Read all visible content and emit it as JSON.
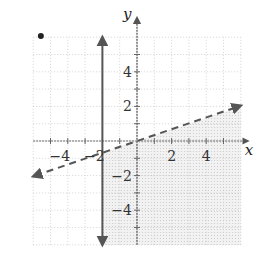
{
  "chart_data": {
    "type": "inequality-graph",
    "title": "",
    "xlabel": "x",
    "ylabel": "y",
    "xlim": [
      -6,
      6
    ],
    "ylim": [
      -6,
      6
    ],
    "grid": true,
    "x_ticks": [
      -4,
      -2,
      2,
      4
    ],
    "y_ticks": [
      4,
      2,
      -2,
      -4
    ],
    "x_tick_labels": [
      "−4",
      "−2",
      "2",
      "4"
    ],
    "y_tick_labels": [
      "4",
      "2",
      "−2",
      "−4"
    ],
    "boundaries": [
      {
        "name": "vertical-line",
        "equation": "x = -2",
        "style": "solid",
        "x": -2,
        "y_range": [
          -6,
          6
        ]
      },
      {
        "name": "slanted-line",
        "equation": "y = x/3",
        "style": "dashed",
        "points": [
          [
            -6,
            -2
          ],
          [
            6,
            2
          ]
        ]
      }
    ],
    "shaded_region": "x >= -2 and y < x/3",
    "annotations": [
      {
        "type": "dot",
        "x": -5.5,
        "y": 6.3
      }
    ],
    "colors": {
      "grid": "#c8c8c8",
      "axis": "#555555",
      "line": "#555555",
      "shade": "#e6e6e6"
    }
  }
}
